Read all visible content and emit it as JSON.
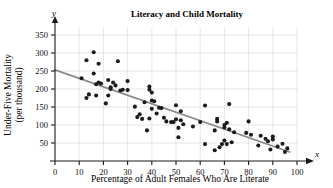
{
  "chart_data": {
    "type": "scatter",
    "title": "Literacy and Child Mortality",
    "xlabel": "Percentage of Adult Females Who Are Literate",
    "ylabel_line1": "Under-Five Mortality",
    "ylabel_line2": "(per thousand)",
    "x_axis_variable": "x",
    "y_axis_variable": "y",
    "xlim": [
      0,
      103
    ],
    "ylim": [
      0,
      372
    ],
    "xticks": [
      0,
      10,
      20,
      30,
      40,
      50,
      60,
      70,
      80,
      90,
      100
    ],
    "yticks": [
      50,
      100,
      150,
      200,
      250,
      300,
      350
    ],
    "grid": true,
    "grid_x_step": 10,
    "grid_y_step": 50,
    "legend": "none",
    "point_color": "#1c1c1c",
    "trend_color": "#8a8a8a",
    "grid_color": "#d7d7d7",
    "axis_color": "#1a1a1a",
    "trend_line": {
      "label": "least-squares regression line",
      "x_start": 0,
      "y_start": 253,
      "x_end": 97,
      "y_end": 25
    },
    "points": [
      {
        "x": 11,
        "y": 230
      },
      {
        "x": 13,
        "y": 280
      },
      {
        "x": 13,
        "y": 175
      },
      {
        "x": 14,
        "y": 185
      },
      {
        "x": 16,
        "y": 302
      },
      {
        "x": 16,
        "y": 243
      },
      {
        "x": 17,
        "y": 213
      },
      {
        "x": 17,
        "y": 182
      },
      {
        "x": 18,
        "y": 270
      },
      {
        "x": 18,
        "y": 218
      },
      {
        "x": 19,
        "y": 215
      },
      {
        "x": 21,
        "y": 160
      },
      {
        "x": 22,
        "y": 182
      },
      {
        "x": 22,
        "y": 225
      },
      {
        "x": 23,
        "y": 205
      },
      {
        "x": 23,
        "y": 200
      },
      {
        "x": 24,
        "y": 218
      },
      {
        "x": 25,
        "y": 210
      },
      {
        "x": 26,
        "y": 277
      },
      {
        "x": 27,
        "y": 196
      },
      {
        "x": 28,
        "y": 198
      },
      {
        "x": 30,
        "y": 222
      },
      {
        "x": 30,
        "y": 197
      },
      {
        "x": 33,
        "y": 151
      },
      {
        "x": 34,
        "y": 122
      },
      {
        "x": 35,
        "y": 130
      },
      {
        "x": 36,
        "y": 117
      },
      {
        "x": 37,
        "y": 163
      },
      {
        "x": 38,
        "y": 85
      },
      {
        "x": 39,
        "y": 207
      },
      {
        "x": 39,
        "y": 198
      },
      {
        "x": 39,
        "y": 118
      },
      {
        "x": 40,
        "y": 190
      },
      {
        "x": 40,
        "y": 168
      },
      {
        "x": 40,
        "y": 145
      },
      {
        "x": 41,
        "y": 166
      },
      {
        "x": 42,
        "y": 132
      },
      {
        "x": 43,
        "y": 148
      },
      {
        "x": 44,
        "y": 147
      },
      {
        "x": 45,
        "y": 120
      },
      {
        "x": 46,
        "y": 110
      },
      {
        "x": 48,
        "y": 108
      },
      {
        "x": 49,
        "y": 108
      },
      {
        "x": 50,
        "y": 155
      },
      {
        "x": 50,
        "y": 116
      },
      {
        "x": 51,
        "y": 92
      },
      {
        "x": 51,
        "y": 66
      },
      {
        "x": 52,
        "y": 138
      },
      {
        "x": 52,
        "y": 113
      },
      {
        "x": 53,
        "y": 102
      },
      {
        "x": 57,
        "y": 96
      },
      {
        "x": 60,
        "y": 108
      },
      {
        "x": 62,
        "y": 154
      },
      {
        "x": 62,
        "y": 47
      },
      {
        "x": 66,
        "y": 85
      },
      {
        "x": 66,
        "y": 30
      },
      {
        "x": 67,
        "y": 117
      },
      {
        "x": 67,
        "y": 110
      },
      {
        "x": 68,
        "y": 38
      },
      {
        "x": 69,
        "y": 47
      },
      {
        "x": 70,
        "y": 100
      },
      {
        "x": 70,
        "y": 93
      },
      {
        "x": 70,
        "y": 57
      },
      {
        "x": 71,
        "y": 106
      },
      {
        "x": 71,
        "y": 47
      },
      {
        "x": 72,
        "y": 158
      },
      {
        "x": 72,
        "y": 88
      },
      {
        "x": 73,
        "y": 52
      },
      {
        "x": 74,
        "y": 80
      },
      {
        "x": 79,
        "y": 78
      },
      {
        "x": 80,
        "y": 110
      },
      {
        "x": 81,
        "y": 73
      },
      {
        "x": 84,
        "y": 43
      },
      {
        "x": 85,
        "y": 70
      },
      {
        "x": 87,
        "y": 62
      },
      {
        "x": 88,
        "y": 55
      },
      {
        "x": 89,
        "y": 32
      },
      {
        "x": 90,
        "y": 68
      },
      {
        "x": 90,
        "y": 60
      },
      {
        "x": 92,
        "y": 40
      },
      {
        "x": 94,
        "y": 48
      },
      {
        "x": 95,
        "y": 25
      },
      {
        "x": 96,
        "y": 35
      }
    ]
  }
}
